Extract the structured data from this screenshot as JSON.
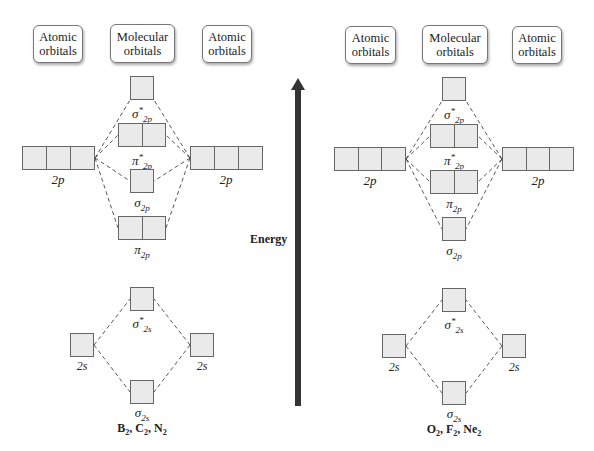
{
  "headers": {
    "atomic": [
      "Atomic",
      "orbitals"
    ],
    "molecular": [
      "Molecular",
      "orbitals"
    ]
  },
  "axis": {
    "label": "Energy",
    "direction": "up",
    "color": "#333333"
  },
  "colors": {
    "box_fill": "#eaeaea",
    "box_border": "#666666",
    "dash": "#444444"
  },
  "diagrams": [
    {
      "molecules": {
        "parts": [
          "B",
          "2",
          ", C",
          "2",
          ", N",
          "2"
        ]
      },
      "atomic_labels": {
        "p": "2p",
        "s": "2s"
      },
      "mo_order_top_to_bottom": [
        "σ*2p",
        "π*2p",
        "σ2p",
        "π2p",
        "σ*2s",
        "σ2s"
      ],
      "labels": {
        "sig_star_2p": {
          "sym": "σ",
          "sup": "*",
          "sub": "2p"
        },
        "pi_star_2p": {
          "sym": "π",
          "sup": "*",
          "sub": "2p"
        },
        "sig_2p": {
          "sym": "σ",
          "sub": "2p"
        },
        "pi_2p": {
          "sym": "π",
          "sub": "2p"
        },
        "sig_star_2s": {
          "sym": "σ",
          "sup": "*",
          "sub": "2s"
        },
        "sig_2s": {
          "sym": "σ",
          "sub": "2s"
        }
      }
    },
    {
      "molecules": {
        "parts": [
          "O",
          "2",
          ", F",
          "2",
          ", Ne",
          "2"
        ]
      },
      "atomic_labels": {
        "p": "2p",
        "s": "2s"
      },
      "mo_order_top_to_bottom": [
        "σ*2p",
        "π*2p",
        "π2p",
        "σ2p",
        "σ*2s",
        "σ2s"
      ],
      "labels": {
        "sig_star_2p": {
          "sym": "σ",
          "sup": "*",
          "sub": "2p"
        },
        "pi_star_2p": {
          "sym": "π",
          "sup": "*",
          "sub": "2p"
        },
        "pi_2p": {
          "sym": "π",
          "sub": "2p"
        },
        "sig_2p": {
          "sym": "σ",
          "sub": "2p"
        },
        "sig_star_2s": {
          "sym": "σ",
          "sup": "*",
          "sub": "2s"
        },
        "sig_2s": {
          "sym": "σ",
          "sub": "2s"
        }
      }
    }
  ]
}
